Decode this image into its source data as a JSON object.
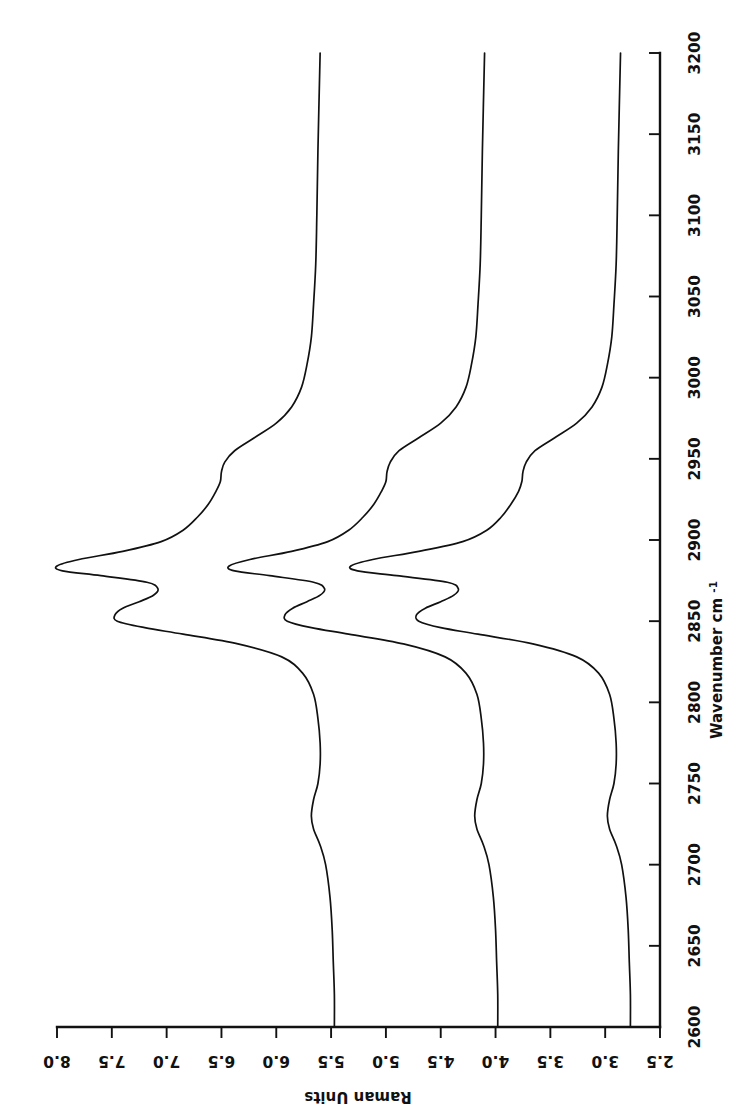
{
  "figure": {
    "orientation": "rotated-90-clockwise",
    "background": "#ffffff",
    "line_color": "#111111"
  },
  "chart_data": {
    "type": "line",
    "title": "",
    "subtitle": "",
    "xlabel": "Wavenumber cm",
    "xlabel_superscript": "-1",
    "ylabel": "Raman Units",
    "xlim": [
      2600,
      3200
    ],
    "ylim": [
      2.5,
      8.0
    ],
    "grid": false,
    "legend": "none",
    "x_ticks": [
      2600,
      2650,
      2700,
      2750,
      2800,
      2850,
      2900,
      2950,
      3000,
      3050,
      3100,
      3150,
      3200
    ],
    "x_tick_labels": [
      "2600",
      "2650",
      "2700",
      "2750",
      "2800",
      "2850",
      "2900",
      "2950",
      "3000",
      "3050",
      "3100",
      "3150",
      "3200"
    ],
    "y_ticks": [
      2.5,
      3.0,
      3.5,
      4.0,
      4.5,
      5.0,
      5.5,
      6.0,
      6.5,
      7.0,
      7.5,
      8.0
    ],
    "y_tick_labels": [
      "2.5",
      "3.0",
      "3.5",
      "4.0",
      "4.5",
      "5.0",
      "5.5",
      "6.0",
      "6.5",
      "7.0",
      "7.5",
      "8.0"
    ],
    "annotations": [],
    "x": [
      2600,
      2620,
      2640,
      2660,
      2680,
      2700,
      2712,
      2722,
      2730,
      2740,
      2750,
      2762,
      2775,
      2790,
      2805,
      2818,
      2828,
      2836,
      2842,
      2846,
      2850,
      2854,
      2858,
      2862,
      2866,
      2870,
      2874,
      2878,
      2881,
      2884,
      2888,
      2893,
      2899,
      2906,
      2914,
      2922,
      2930,
      2936,
      2942,
      2948,
      2955,
      2963,
      2972,
      2982,
      2994,
      3008,
      3025,
      3045,
      3070,
      3100,
      3140,
      3200
    ],
    "series": [
      {
        "name": "spectrum-1",
        "baseline": 5.47,
        "peak_main_wavenumber": 2881,
        "peak_main_value": 8.0,
        "peak_second_wavenumber": 2850,
        "peak_second_value": 7.47,
        "shoulder_wavenumber": 2940,
        "shoulder_value": 6.5,
        "values": [
          5.47,
          5.47,
          5.48,
          5.49,
          5.51,
          5.55,
          5.6,
          5.66,
          5.68,
          5.66,
          5.62,
          5.6,
          5.6,
          5.62,
          5.66,
          5.76,
          5.95,
          6.35,
          6.85,
          7.2,
          7.45,
          7.47,
          7.4,
          7.25,
          7.12,
          7.08,
          7.18,
          7.6,
          7.95,
          8.0,
          7.8,
          7.4,
          7.05,
          6.85,
          6.72,
          6.62,
          6.55,
          6.51,
          6.5,
          6.47,
          6.38,
          6.2,
          6.0,
          5.86,
          5.77,
          5.72,
          5.68,
          5.66,
          5.64,
          5.63,
          5.62,
          5.6
        ]
      },
      {
        "name": "spectrum-2",
        "baseline": 3.98,
        "peak_main_wavenumber": 2881,
        "peak_main_value": 6.43,
        "peak_second_wavenumber": 2850,
        "peak_second_value": 5.92,
        "shoulder_wavenumber": 2940,
        "shoulder_value": 5.0,
        "values": [
          3.98,
          3.98,
          3.99,
          4.0,
          4.02,
          4.06,
          4.11,
          4.17,
          4.19,
          4.17,
          4.13,
          4.11,
          4.11,
          4.13,
          4.17,
          4.27,
          4.46,
          4.84,
          5.34,
          5.68,
          5.9,
          5.92,
          5.85,
          5.72,
          5.6,
          5.56,
          5.66,
          6.06,
          6.38,
          6.43,
          6.24,
          5.86,
          5.53,
          5.34,
          5.21,
          5.11,
          5.04,
          5.0,
          4.99,
          4.96,
          4.88,
          4.7,
          4.5,
          4.36,
          4.27,
          4.22,
          4.18,
          4.16,
          4.14,
          4.13,
          4.12,
          4.1
        ]
      },
      {
        "name": "spectrum-3",
        "baseline": 2.77,
        "peak_main_wavenumber": 2881,
        "peak_main_value": 5.32,
        "peak_second_wavenumber": 2850,
        "peak_second_value": 4.72,
        "shoulder_wavenumber": 2940,
        "shoulder_value": 3.76,
        "values": [
          2.77,
          2.77,
          2.78,
          2.79,
          2.81,
          2.85,
          2.9,
          2.96,
          2.98,
          2.96,
          2.92,
          2.9,
          2.9,
          2.92,
          2.96,
          3.06,
          3.26,
          3.66,
          4.16,
          4.5,
          4.7,
          4.72,
          4.64,
          4.5,
          4.38,
          4.34,
          4.44,
          4.9,
          5.26,
          5.32,
          5.12,
          4.7,
          4.3,
          4.08,
          3.95,
          3.86,
          3.79,
          3.76,
          3.75,
          3.72,
          3.64,
          3.46,
          3.26,
          3.12,
          3.03,
          2.98,
          2.94,
          2.92,
          2.9,
          2.89,
          2.88,
          2.86
        ]
      }
    ]
  }
}
